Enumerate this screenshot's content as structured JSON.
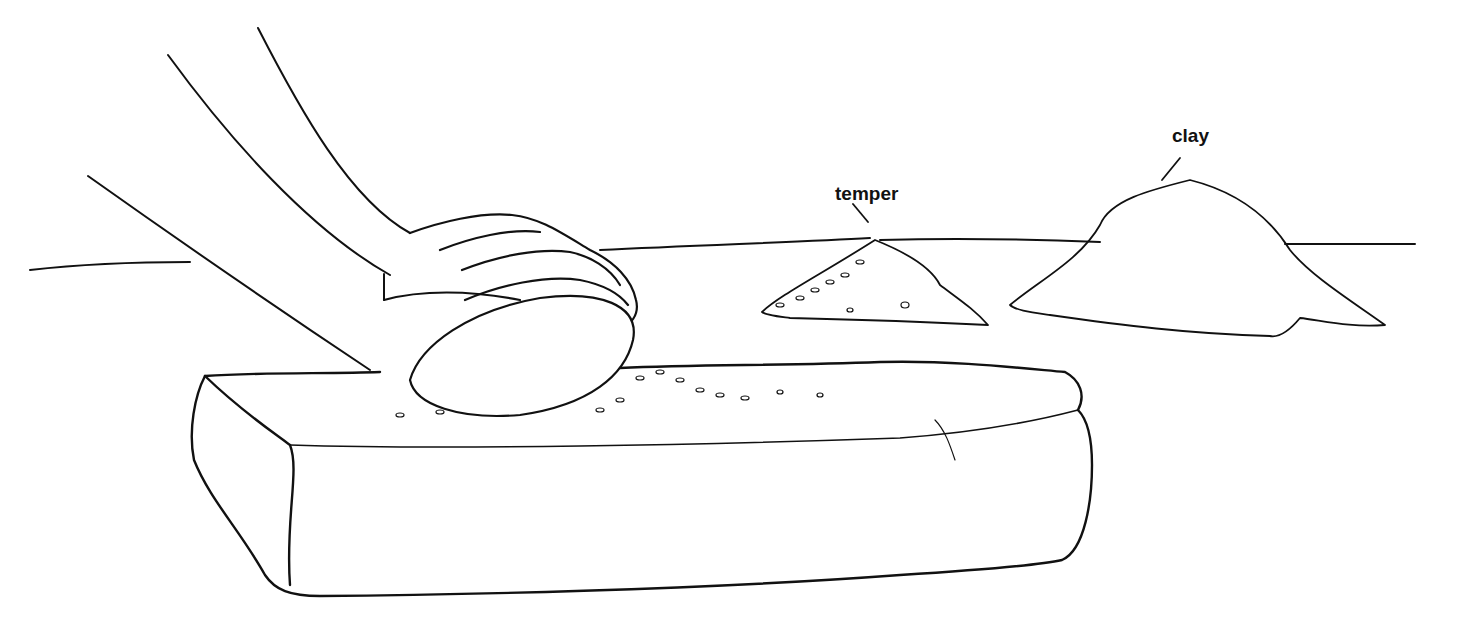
{
  "labels": {
    "temper": "temper",
    "clay": "clay"
  },
  "colors": {
    "ink": "#111111",
    "background": "#ffffff"
  }
}
